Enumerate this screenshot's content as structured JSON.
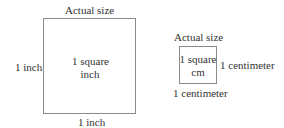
{
  "large_square": {
    "caption": "Actual size",
    "side_label_left": "1 inch",
    "side_label_bottom": "1 inch",
    "inner_line1": "1 square",
    "inner_line2": "inch"
  },
  "small_square": {
    "caption": "Actual size",
    "side_label_right": "1 centimeter",
    "side_label_bottom": "1 centimeter",
    "inner_line1": "1 square",
    "inner_line2": "cm"
  },
  "colors": {
    "border": "#8a8a8a",
    "text": "#333333"
  }
}
